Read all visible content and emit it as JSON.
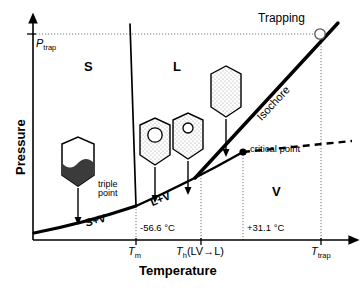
{
  "figure": {
    "type": "phase-diagram",
    "substance_implied": "CO2",
    "axes": {
      "x_title": "Temperature",
      "y_title": "Pressure",
      "x_tick_labels": [
        "T",
        "m",
        "T",
        "h",
        "(LV→L)",
        "T",
        "trap"
      ],
      "x_ticks": [
        {
          "id": "tm",
          "var": "T",
          "sub": "m",
          "suffix": "",
          "value_label": "-56.6 °C"
        },
        {
          "id": "th",
          "var": "T",
          "sub": "h",
          "suffix": "(LV→L)",
          "value_label": ""
        },
        {
          "id": "tcrit",
          "var": "",
          "sub": "",
          "suffix": "",
          "value_label": "+31.1 °C"
        },
        {
          "id": "ttrap",
          "var": "T",
          "sub": "trap",
          "suffix": "",
          "value_label": ""
        }
      ],
      "y_ticks": [
        {
          "id": "ptrap",
          "var": "P",
          "sub": "trap",
          "value_label": ""
        }
      ]
    },
    "regions": [
      {
        "id": "solid",
        "label": "S"
      },
      {
        "id": "liquid",
        "label": "L"
      },
      {
        "id": "vapor",
        "label": "V"
      },
      {
        "id": "solid-vapor",
        "label": "S+V"
      },
      {
        "id": "liquid-vapor",
        "label": "L+V"
      }
    ],
    "annotations": [
      {
        "id": "triple-point",
        "label": "triple\npoint",
        "line1": "triple",
        "line2": "point"
      },
      {
        "id": "critical-point",
        "label": "critical point"
      },
      {
        "id": "trapping",
        "label": "Trapping"
      },
      {
        "id": "isochore",
        "label": "Isochore"
      }
    ],
    "colors": {
      "line": "#000000",
      "text": "#000000",
      "stipple": "#9a9a9a",
      "solid_fill": "#3b3b3b",
      "guide": "#6f6f6f",
      "background": "#ffffff"
    },
    "inclusions": [
      {
        "id": "inclusion-solid-vapor",
        "state": "S+V",
        "has_bubble": false,
        "fill": "solid-bottom"
      },
      {
        "id": "inclusion-liquid-vapor-large-bubble",
        "state": "L+V",
        "has_bubble": true,
        "fill": "stipple"
      },
      {
        "id": "inclusion-liquid-vapor-small-bubble",
        "state": "L+V",
        "has_bubble": true,
        "fill": "stipple"
      },
      {
        "id": "inclusion-homogeneous-liquid",
        "state": "L",
        "has_bubble": false,
        "fill": "stipple"
      }
    ]
  }
}
